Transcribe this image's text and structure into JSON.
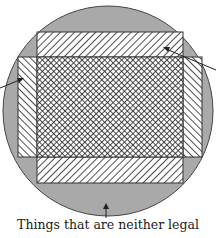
{
  "diagram": {
    "type": "venn-like overlapping rectangles in a circle",
    "colors": {
      "circle_fill": "#a9a9a9",
      "stroke": "#333333",
      "hatch_line": "#222222",
      "background": "#ffffff"
    },
    "regions": [
      {
        "name": "outer-circle",
        "fill": "solid gray"
      },
      {
        "name": "horizontal-rectangle-bands",
        "fill": "diagonal hatch"
      },
      {
        "name": "vertical-rectangle-bands",
        "fill": "diagonal hatch (opposite direction)"
      },
      {
        "name": "overlap-center",
        "fill": "crosshatch"
      }
    ],
    "caption": "Things that are neither legal"
  }
}
